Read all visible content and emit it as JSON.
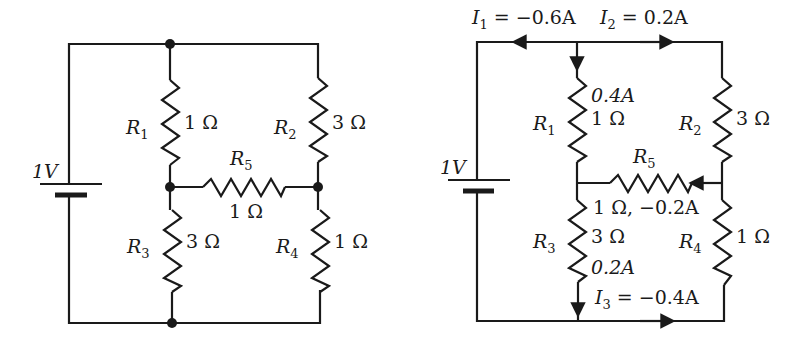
{
  "diagrams": [
    {
      "name": "original-circuit",
      "battery": {
        "label": "1V"
      },
      "resistors": [
        {
          "id": "R1",
          "name": "R",
          "sub": "1",
          "value": "1 Ω"
        },
        {
          "id": "R2",
          "name": "R",
          "sub": "2",
          "value": "3 Ω"
        },
        {
          "id": "R3",
          "name": "R",
          "sub": "3",
          "value": "3 Ω"
        },
        {
          "id": "R4",
          "name": "R",
          "sub": "4",
          "value": "1 Ω"
        },
        {
          "id": "R5",
          "name": "R",
          "sub": "5",
          "value": "1 Ω"
        }
      ]
    },
    {
      "name": "solved-circuit",
      "battery": {
        "label": "1V"
      },
      "resistors": [
        {
          "id": "R1",
          "name": "R",
          "sub": "1",
          "value": "1 Ω",
          "current": "0.4A"
        },
        {
          "id": "R2",
          "name": "R",
          "sub": "2",
          "value": "3 Ω"
        },
        {
          "id": "R3",
          "name": "R",
          "sub": "3",
          "value": "3 Ω",
          "current": "0.2A"
        },
        {
          "id": "R4",
          "name": "R",
          "sub": "4",
          "value": "1 Ω"
        },
        {
          "id": "R5",
          "name": "R",
          "sub": "5",
          "value": "1 Ω, −0.2A"
        }
      ],
      "currents": {
        "I1": {
          "name": "I",
          "sub": "1",
          "value": " = −0.6A"
        },
        "I2": {
          "name": "I",
          "sub": "2",
          "value": " = 0.2A"
        },
        "I3": {
          "name": "I",
          "sub": "3",
          "value": " = −0.4A"
        }
      }
    }
  ]
}
